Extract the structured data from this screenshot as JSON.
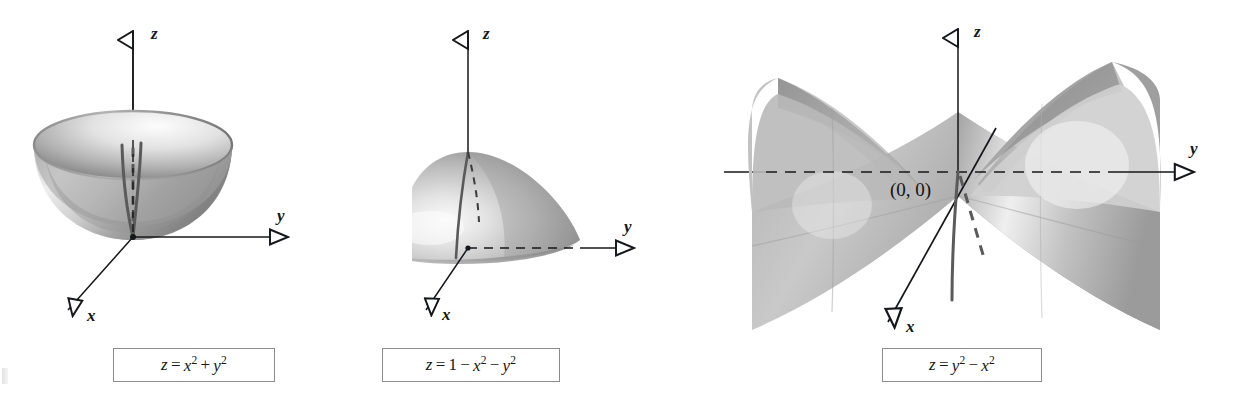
{
  "figure": {
    "background_color": "#ffffff",
    "surface_gray_dark": "#6f6f6f",
    "surface_gray_mid": "#a8a8a8",
    "surface_gray_light": "#e6e6e6",
    "axis_color": "#15171a",
    "trace_color": "#5a5a5a",
    "caption_border_color": "#8c8c8c"
  },
  "panels": [
    {
      "id": "paraboloid-bowl",
      "surface_type": "elliptic paraboloid opening upward",
      "caption": {
        "lhs": "z",
        "equals": "=",
        "terms": [
          {
            "base": "x",
            "exp": "2"
          },
          {
            "op": "+"
          },
          {
            "base": "y",
            "exp": "2"
          }
        ],
        "plain": "z = x2 + y2"
      },
      "axes": [
        {
          "name": "z",
          "label": "z",
          "direction": "up",
          "arrow": "open-triangle"
        },
        {
          "name": "y",
          "label": "y",
          "direction": "right",
          "arrow": "open-triangle"
        },
        {
          "name": "x",
          "label": "x",
          "direction": "down-left",
          "arrow": "open-triangle"
        }
      ],
      "traces": [
        {
          "kind": "solid",
          "description": "front trace in x-direction"
        },
        {
          "kind": "dashed",
          "description": "hidden trace in y-direction"
        }
      ],
      "vertex": "origin (0, 0, 0)"
    },
    {
      "id": "paraboloid-dome",
      "surface_type": "elliptic paraboloid opening downward",
      "caption": {
        "lhs": "z",
        "equals": "=",
        "terms": [
          {
            "base": "1"
          },
          {
            "op": "−"
          },
          {
            "base": "x",
            "exp": "2"
          },
          {
            "op": "−"
          },
          {
            "base": "y",
            "exp": "2"
          }
        ],
        "plain": "z = 1 - x2 - y2"
      },
      "axes": [
        {
          "name": "z",
          "label": "z",
          "direction": "up",
          "arrow": "open-triangle"
        },
        {
          "name": "y",
          "label": "y",
          "direction": "right",
          "arrow": "open-triangle"
        },
        {
          "name": "x",
          "label": "x",
          "direction": "down-left",
          "arrow": "open-triangle"
        }
      ],
      "traces": [
        {
          "kind": "solid",
          "description": "front trace from apex down to x-axis"
        },
        {
          "kind": "dashed",
          "description": "hidden trace from apex toward y"
        },
        {
          "kind": "dashed",
          "description": "hidden base radius along y-axis"
        }
      ],
      "apex": "(0, 0, 1)"
    },
    {
      "id": "hyperbolic-paraboloid-saddle",
      "surface_type": "hyperbolic paraboloid (saddle)",
      "caption": {
        "lhs": "z",
        "equals": "=",
        "terms": [
          {
            "base": "y",
            "exp": "2"
          },
          {
            "op": "−"
          },
          {
            "base": "x",
            "exp": "2"
          }
        ],
        "plain": "z = y2 - x2"
      },
      "axes": [
        {
          "name": "z",
          "label": "z",
          "direction": "up",
          "arrow": "open-triangle"
        },
        {
          "name": "y",
          "label": "y",
          "direction": "right",
          "arrow": "open-triangle"
        },
        {
          "name": "x",
          "label": "x",
          "direction": "down-left",
          "arrow": "open-triangle"
        }
      ],
      "point_label": "(0, 0)",
      "traces": [
        {
          "kind": "solid",
          "description": "upward parabola trace in x-direction"
        },
        {
          "kind": "dashed",
          "description": "hidden downward trace in y-direction"
        }
      ],
      "saddle_point": "origin (0, 0, 0)"
    }
  ]
}
